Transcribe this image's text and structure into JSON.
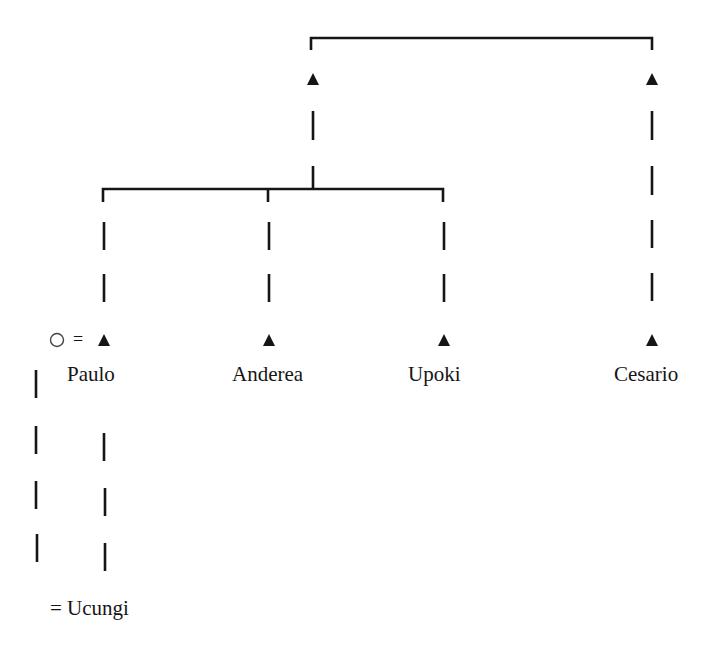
{
  "diagram": {
    "type": "kinship-chart",
    "colors": {
      "ink": "#151515",
      "background": "#ffffff"
    },
    "symbols": {
      "male": "filled-triangle",
      "female": "open-circle",
      "marriage": "=",
      "descent": "dashed-line",
      "siblings": "bracket"
    },
    "people": [
      {
        "id": "gp_left",
        "symbol": "male",
        "label": ""
      },
      {
        "id": "gp_right",
        "symbol": "male",
        "label": ""
      },
      {
        "id": "paulo",
        "symbol": "male",
        "label": "Paulo"
      },
      {
        "id": "paulo_wife",
        "symbol": "female",
        "label": ""
      },
      {
        "id": "anderea",
        "symbol": "male",
        "label": "Anderea"
      },
      {
        "id": "upoki",
        "symbol": "male",
        "label": "Upoki"
      },
      {
        "id": "cesario",
        "symbol": "male",
        "label": "Cesario"
      },
      {
        "id": "ucungi",
        "symbol": "",
        "label": "Ucungi"
      }
    ],
    "labels": {
      "paulo": "Paulo",
      "anderea": "Anderea",
      "upoki": "Upoki",
      "cesario": "Cesario",
      "marriage_sign": "=",
      "ucungi": "= Ucungi"
    },
    "relations": [
      {
        "type": "siblings",
        "members": [
          "gp_left",
          "gp_right"
        ]
      },
      {
        "type": "descent",
        "from": "gp_left",
        "to": [
          "paulo",
          "anderea",
          "upoki"
        ]
      },
      {
        "type": "descent",
        "from": "gp_right",
        "to": [
          "cesario"
        ]
      },
      {
        "type": "marriage",
        "members": [
          "paulo_wife",
          "paulo"
        ]
      },
      {
        "type": "descent",
        "from": [
          "paulo_wife",
          "paulo"
        ],
        "to": [
          "ucungi"
        ]
      }
    ]
  }
}
